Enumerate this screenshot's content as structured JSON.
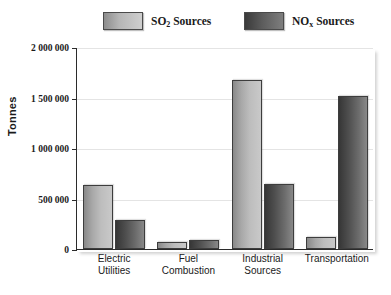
{
  "chart_data": {
    "type": "bar",
    "title": "",
    "xlabel": "",
    "ylabel": "Tonnes",
    "ylim": [
      0,
      2000000
    ],
    "grid": true,
    "legend_position": "top",
    "categories": [
      "Electric Utilities",
      "Fuel Combustion",
      "Industrial Sources",
      "Transportation"
    ],
    "category_lines": [
      [
        "Electric",
        "Utilities"
      ],
      [
        "Fuel",
        "Combustion"
      ],
      [
        "Industrial",
        "Sources"
      ],
      [
        "Transportation"
      ]
    ],
    "ytick_labels": [
      "2 000 000",
      "1 500 000",
      "1 000 000",
      "500 000",
      "0"
    ],
    "ytick_values": [
      2000000,
      1500000,
      1000000,
      500000,
      0
    ],
    "series": [
      {
        "name": "SO2 Sources",
        "name_base": "SO",
        "name_sub": "2",
        "name_suffix": " Sources",
        "color": "#b6b6b6",
        "values": [
          635000,
          70000,
          1670000,
          120000
        ]
      },
      {
        "name": "NOx Sources",
        "name_base": "NO",
        "name_sub": "x",
        "name_suffix": " Sources",
        "color": "#5c5c5c",
        "values": [
          287000,
          90000,
          640000,
          1515000
        ]
      }
    ]
  }
}
